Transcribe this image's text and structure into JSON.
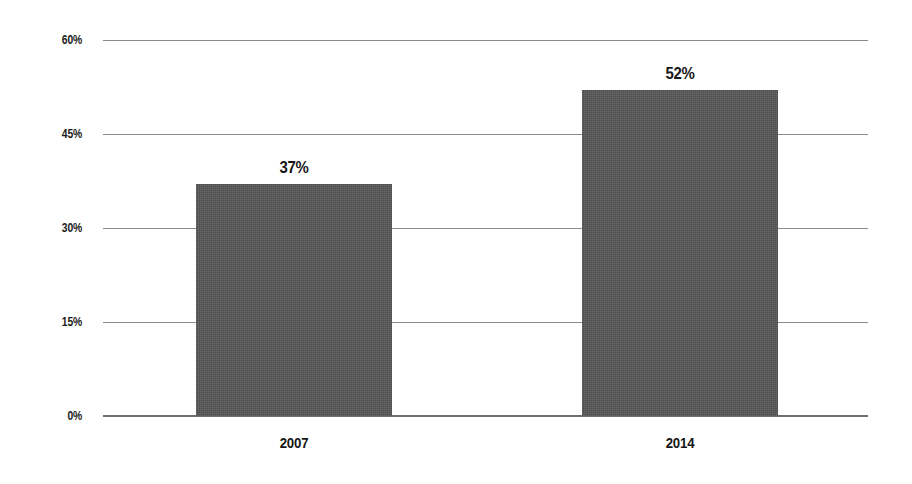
{
  "chart_data": {
    "type": "bar",
    "title": "",
    "subtitle": "",
    "xlabel": "",
    "ylabel": "",
    "categories": [
      "2007",
      "2014"
    ],
    "values": [
      37,
      52
    ],
    "data_labels": [
      "37%",
      "52%"
    ],
    "ylim": [
      0,
      60
    ],
    "yticks": [
      0,
      15,
      30,
      45,
      60
    ],
    "ytick_labels": [
      "0%",
      "15%",
      "30%",
      "45%",
      "60%"
    ],
    "grid": true,
    "grid_axis": "y",
    "legend": false,
    "legend_position": "none",
    "series": [
      {
        "name": "",
        "values": [
          37,
          52
        ]
      }
    ],
    "colors": {
      "bar_fill": "#565656",
      "gridline": "#8c8c8c",
      "baseline": "#6e6e6e",
      "label_text": "#161616",
      "background": "#ffffff"
    }
  }
}
